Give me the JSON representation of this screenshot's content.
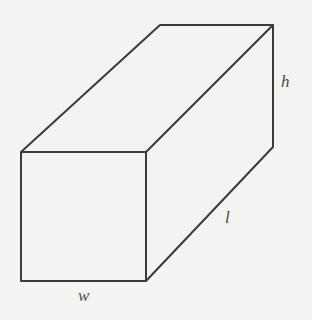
{
  "diagram": {
    "type": "rectangular prism",
    "labels": {
      "height": "h",
      "length": "l",
      "width": "w"
    },
    "colors": {
      "background": "#f3f3f1",
      "stroke": "#3a3a3a",
      "label": "#4a4a4a"
    }
  }
}
